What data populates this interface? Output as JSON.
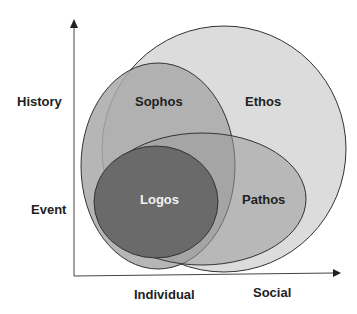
{
  "diagram": {
    "type": "nested-venn",
    "axes": {
      "y_labels": [
        "History",
        "Event"
      ],
      "x_labels": [
        "Individual",
        "Social"
      ]
    },
    "regions": [
      {
        "id": "ethos",
        "label": "Ethos",
        "fill": "#dcdcdc",
        "text_color": "#222222"
      },
      {
        "id": "sophos",
        "label": "Sophos",
        "fill": "#a9a9a9",
        "text_color": "#222222"
      },
      {
        "id": "pathos",
        "label": "Pathos",
        "fill": "#b8b8b8",
        "text_color": "#222222"
      },
      {
        "id": "logos",
        "label": "Logos",
        "fill": "#6e6e6e",
        "text_color": "#f2f2f2"
      }
    ],
    "colors": {
      "outline": "#333333",
      "axis": "#444444"
    }
  }
}
